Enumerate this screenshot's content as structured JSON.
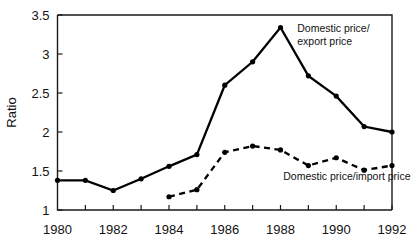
{
  "chart_data": {
    "type": "line",
    "title": "",
    "xlabel": "",
    "ylabel": "Ratio",
    "xlim": [
      1980,
      1992
    ],
    "ylim": [
      1,
      3.5
    ],
    "grid": false,
    "legend_position": "inline-annotations",
    "x_tick_labels": [
      "1980",
      "1982",
      "1984",
      "1986",
      "1988",
      "1990",
      "1992"
    ],
    "x_tick_values": [
      1980,
      1982,
      1984,
      1986,
      1988,
      1990,
      1992
    ],
    "x_minor_tick_values": [
      1981,
      1983,
      1985,
      1987,
      1989,
      1991
    ],
    "y_tick_labels": [
      "1",
      "1.5",
      "2",
      "2.5",
      "3",
      "3.5"
    ],
    "y_tick_values": [
      1,
      1.5,
      2,
      2.5,
      3,
      3.5
    ],
    "series": [
      {
        "name": "Domestic price/export price",
        "style": "solid",
        "marker": "filled-circle",
        "color": "#000000",
        "x": [
          1980,
          1981,
          1982,
          1983,
          1984,
          1985,
          1986,
          1987,
          1988,
          1989,
          1990,
          1991,
          1992
        ],
        "values": [
          1.38,
          1.38,
          1.25,
          1.4,
          1.56,
          1.71,
          2.6,
          2.9,
          3.34,
          2.72,
          2.46,
          2.07,
          2.0
        ]
      },
      {
        "name": "Domestic price/import price",
        "style": "dashed",
        "marker": "filled-circle",
        "color": "#000000",
        "x": [
          1984,
          1985,
          1986,
          1987,
          1988,
          1989,
          1990,
          1991,
          1992
        ],
        "values": [
          1.17,
          1.26,
          1.74,
          1.82,
          1.77,
          1.57,
          1.67,
          1.51,
          1.57
        ]
      }
    ],
    "annotations": [
      {
        "id": "annot-export",
        "lines": [
          "Domestic price/",
          "export price"
        ],
        "x": 1988.6,
        "y": 3.28,
        "anchor": "start"
      },
      {
        "id": "annot-import",
        "lines": [
          "Domestic price/import price"
        ],
        "x": 1988.1,
        "y": 1.38,
        "anchor": "start"
      }
    ]
  }
}
